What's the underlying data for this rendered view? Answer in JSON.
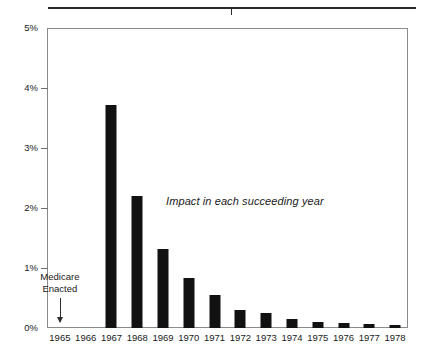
{
  "chart_data": {
    "type": "bar",
    "title": "",
    "subtitle": "",
    "xlabel": "",
    "ylabel": "",
    "categories": [
      "1965",
      "1966",
      "1967",
      "1968",
      "1969",
      "1970",
      "1971",
      "1972",
      "1973",
      "1974",
      "1975",
      "1976",
      "1977",
      "1978"
    ],
    "values": [
      0,
      0,
      3.72,
      2.2,
      1.32,
      0.83,
      0.55,
      0.3,
      0.25,
      0.15,
      0.1,
      0.08,
      0.06,
      0.05
    ],
    "ylim": [
      0,
      5
    ],
    "ytick_values": [
      0,
      1,
      2,
      3,
      4,
      5
    ],
    "ytick_labels": [
      "0%",
      "1%",
      "2%",
      "3%",
      "4%",
      "5%"
    ],
    "xtick_labels": [
      "1965",
      "1966",
      "1967",
      "1968",
      "1969",
      "1970",
      "1971",
      "1972",
      "1973",
      "1974",
      "1975",
      "1976",
      "1977",
      "1978"
    ],
    "grid": false,
    "legend": null,
    "legend_position": "none",
    "bar_color": "#111111",
    "frame_color": "#8a8a8a",
    "annotations": [
      {
        "name": "impact-note",
        "text": "Impact in each succeeding year",
        "style": "italic",
        "x": "1971",
        "y": 2.2
      },
      {
        "name": "medicare-enacted-note",
        "text_line_1": "Medicare",
        "text_line_2": "Enacted",
        "arrow": "down-arrow",
        "points_to": "1965"
      }
    ]
  },
  "figure": {
    "top_rule": {
      "name": "header-rule",
      "tick": "center-tick"
    }
  }
}
